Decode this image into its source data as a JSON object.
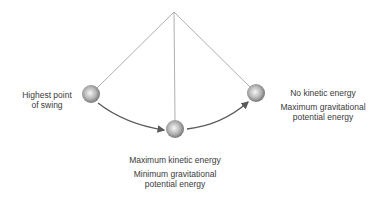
{
  "diagram": {
    "type": "pendulum-energy",
    "pivot": {
      "x": 174,
      "y": 12
    },
    "colors": {
      "string": "#9a9a9a",
      "arrow": "#5a5a5a",
      "ball_light": "#f4f4f4",
      "ball_dark": "#6e6e6e",
      "text": "#3a3a3a"
    },
    "nodes": [
      {
        "id": "left",
        "x": 91,
        "y": 94,
        "r": 9
      },
      {
        "id": "bottom",
        "x": 175,
        "y": 129,
        "r": 9
      },
      {
        "id": "right",
        "x": 256,
        "y": 93,
        "r": 9
      }
    ],
    "labels": {
      "left": {
        "line1": "Highest point",
        "line2": "of swing"
      },
      "right": {
        "line1": "No kinetic energy",
        "line2": "Maximum gravitational",
        "line3": "potential energy"
      },
      "bottom": {
        "line1": "Maximum kinetic energy",
        "line2": "Minimum gravitational",
        "line3": "potential energy"
      }
    }
  }
}
